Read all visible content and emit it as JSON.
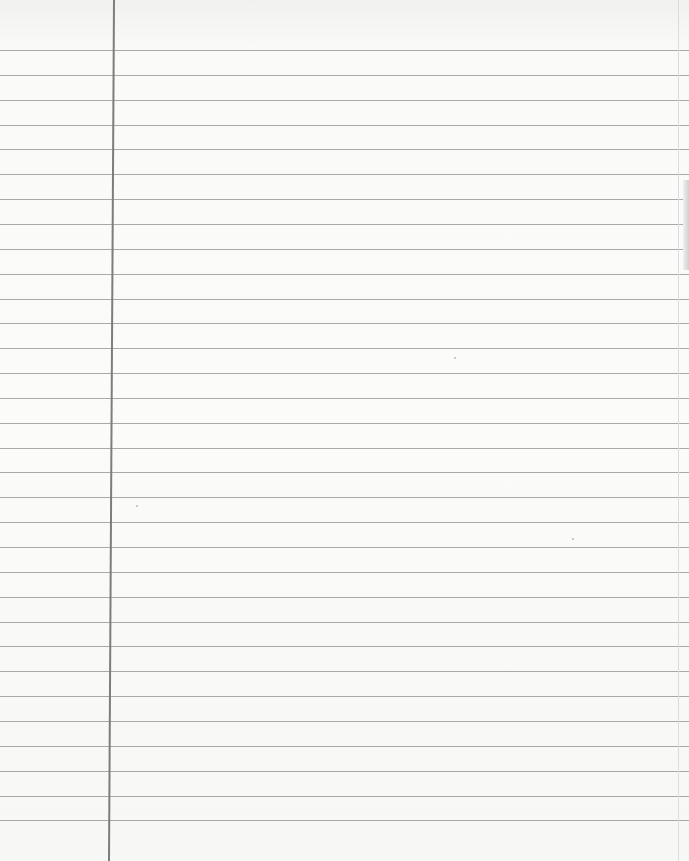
{
  "paper": {
    "type": "lined notebook paper",
    "content": "blank",
    "rule_count": 32,
    "first_rule_y": 50,
    "rule_spacing": 24.85,
    "rule_color": "#a9a9a9",
    "margin_line_x_top": 113,
    "margin_line_x_bottom": 108,
    "margin_line_color": "#7d7d7d",
    "background_color": "#fafaf8"
  }
}
